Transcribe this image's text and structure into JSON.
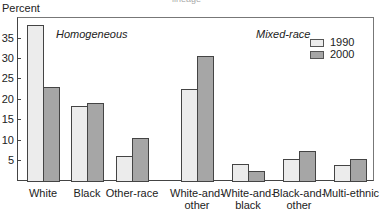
{
  "chart_data": {
    "type": "bar",
    "title": "",
    "xlabel": "",
    "ylabel": "Percent",
    "ylim": [
      0,
      40
    ],
    "yticks": [
      5,
      10,
      15,
      20,
      25,
      30,
      35
    ],
    "grid": false,
    "legend_position": "top-right",
    "section_labels": [
      "Homogeneous",
      "Mixed-race"
    ],
    "categories": [
      "White",
      "Black",
      "Other-race",
      "White-and-other",
      "White-and-black",
      "Black-and-other",
      "Multi-ethnic"
    ],
    "series": [
      {
        "name": "1990",
        "color": "#ececec",
        "values": [
          38,
          18.3,
          6.1,
          22.4,
          4.1,
          5.4,
          3.9
        ]
      },
      {
        "name": "2000",
        "color": "#a6a6a6",
        "values": [
          23,
          19,
          10.5,
          30.5,
          2.5,
          7.3,
          5.4
        ]
      }
    ]
  },
  "labels": {
    "ylabel": "Percent",
    "top_fragment": "lineage",
    "homogeneous": "Homogeneous",
    "mixed": "Mixed-race",
    "legend_1990": "1990",
    "legend_2000": "2000",
    "ticks": [
      "35",
      "30",
      "25",
      "20",
      "15",
      "10",
      "5"
    ],
    "cat": [
      [
        "White",
        ""
      ],
      [
        "Black",
        ""
      ],
      [
        "Other-race",
        ""
      ],
      [
        "White-and-",
        "other"
      ],
      [
        "White-and-",
        "black"
      ],
      [
        "Black-and-",
        "other"
      ],
      [
        "Multi-ethnic",
        ""
      ]
    ]
  }
}
